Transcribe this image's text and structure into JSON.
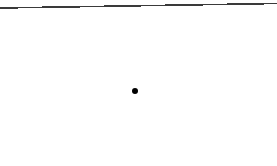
{
  "figure": {
    "width": 277,
    "height": 166,
    "background_color": "#ffffff"
  },
  "borders": {
    "top_rule": {
      "name": "top-border-rule",
      "color": "#3a3a3a",
      "thickness": 1.6,
      "x_start": 0,
      "y_start": 8,
      "x_end": 277,
      "y_end": 3.5
    },
    "right_rule": {
      "name": "right-border-rule",
      "color": "#9a9a9a",
      "color_fade": "#ffffff",
      "thickness": 1,
      "x": 275,
      "y_start": 4,
      "y_end": 112
    },
    "left_rule": null,
    "bottom_rule": null
  },
  "marks": [
    {
      "name": "data-point",
      "shape": "circle",
      "color": "#000000",
      "cx": 135,
      "cy": 91,
      "diameter": 6
    }
  ]
}
